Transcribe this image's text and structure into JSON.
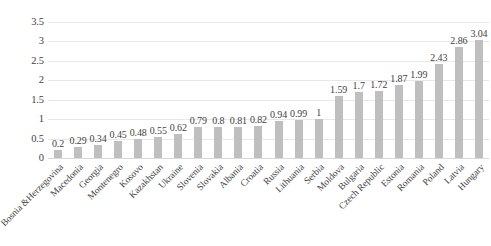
{
  "chart_data": {
    "type": "bar",
    "title": "",
    "subtitle": "",
    "xlabel": "",
    "ylabel": "",
    "ylim": [
      0,
      3.5
    ],
    "ytick_labels": [
      "0",
      "0.5",
      "1",
      "1.5",
      "2",
      "2.5",
      "3",
      "3.5"
    ],
    "ytick_values": [
      0,
      0.5,
      1,
      1.5,
      2,
      2.5,
      3,
      3.5
    ],
    "grid": true,
    "legend": null,
    "legend_position": "none",
    "bar_color": "#bfbfbf",
    "gridline_color": "#e8e8e8",
    "text_color": "#3f3f3f",
    "data_labels": true,
    "categories": [
      "Bosnia &Herzegovina",
      "Macedonia",
      "Georgia",
      "Montenegro",
      "Kosovo",
      "Kazakhstan",
      "Ukraine",
      "Slovenia",
      "Slovakia",
      "Albania",
      "Croatia",
      "Russia",
      "Lithuania",
      "Serbia",
      "Moldova",
      "Bulgaria",
      "Czech Republic",
      "Estonia",
      "Romania",
      "Poland",
      "Latvia",
      "Hungary"
    ],
    "values": [
      0.2,
      0.29,
      0.34,
      0.45,
      0.48,
      0.55,
      0.62,
      0.79,
      0.8,
      0.81,
      0.82,
      0.94,
      0.99,
      1,
      1.59,
      1.7,
      1.72,
      1.87,
      1.99,
      2.43,
      2.86,
      3.04
    ],
    "value_labels": [
      "0.2",
      "0.29",
      "0.34",
      "0.45",
      "0.48",
      "0.55",
      "0.62",
      "0.79",
      "0.8",
      "0.81",
      "0.82",
      "0.94",
      "0.99",
      "1",
      "1.59",
      "1.7",
      "1.72",
      "1.87",
      "1.99",
      "2.43",
      "2.86",
      "3.04"
    ]
  }
}
